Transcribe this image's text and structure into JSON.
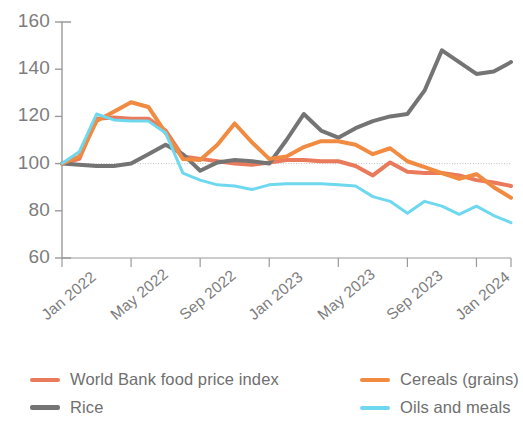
{
  "chart_data": {
    "type": "line",
    "title": "",
    "subtitle": "",
    "xlabel": "",
    "ylabel": "",
    "xlim": [
      0,
      26
    ],
    "ylim": [
      60,
      160
    ],
    "yticks": [
      60,
      80,
      100,
      120,
      140,
      160
    ],
    "xticks": [
      0,
      4,
      8,
      12,
      16,
      20,
      24
    ],
    "xticklabels": [
      "Jan 2022",
      "May 2022",
      "Sep 2022",
      "Jan 2023",
      "May 2023",
      "Sep 2023",
      "Jan 2024"
    ],
    "grid": false,
    "legend_position": "bottom",
    "x": [
      0,
      1,
      2,
      3,
      4,
      5,
      6,
      7,
      8,
      9,
      10,
      11,
      12,
      13,
      14,
      15,
      16,
      17,
      18,
      19,
      20,
      21,
      22,
      23,
      24,
      25,
      26
    ],
    "x_month_labels": [
      "Jan 2022",
      "Feb 2022",
      "Mar 2022",
      "Apr 2022",
      "May 2022",
      "Jun 2022",
      "Jul 2022",
      "Aug 2022",
      "Sep 2022",
      "Oct 2022",
      "Nov 2022",
      "Dec 2022",
      "Jan 2023",
      "Feb 2023",
      "Mar 2023",
      "Apr 2023",
      "May 2023",
      "Jun 2023",
      "Jul 2023",
      "Aug 2023",
      "Sep 2023",
      "Oct 2023",
      "Nov 2023",
      "Dec 2023",
      "Jan 2024",
      "Feb 2024",
      "Mar 2024"
    ],
    "series": [
      {
        "name": "World Bank food price index",
        "color": "#ea7a5c",
        "width": 4,
        "values": [
          100,
          102,
          119,
          119.5,
          119,
          119,
          114,
          103,
          102,
          101,
          100,
          99.5,
          100.5,
          101.5,
          101.5,
          101,
          101,
          99,
          95,
          100.5,
          96.5,
          96,
          96,
          95,
          93,
          92,
          90.5
        ]
      },
      {
        "name": "Rice",
        "color": "#747474",
        "width": 4,
        "values": [
          100,
          99.5,
          99,
          99,
          100,
          104,
          108,
          104,
          97,
          100.5,
          101.5,
          101,
          100,
          110,
          121,
          114,
          111,
          115,
          118,
          120,
          121,
          131,
          148,
          143,
          138,
          139,
          143
        ]
      },
      {
        "name": "Cereals (grains)",
        "color": "#f08b41",
        "width": 4,
        "values": [
          100,
          103,
          118,
          122,
          126,
          124,
          113,
          102,
          101.5,
          108,
          117,
          109,
          102,
          103,
          107,
          109.5,
          109.5,
          108,
          104,
          106.5,
          101,
          98.5,
          96,
          93.5,
          95.5,
          90,
          85.5
        ]
      },
      {
        "name": "Oils and meals",
        "color": "#6ed8ef",
        "width": 3,
        "values": [
          100,
          105,
          121,
          118.5,
          118,
          118,
          113,
          96,
          93,
          91,
          90.5,
          89,
          91,
          91.5,
          91.5,
          91.5,
          91,
          90.5,
          86,
          84,
          79,
          84,
          82,
          78.5,
          82,
          78,
          75
        ]
      }
    ],
    "series_late": {
      "note": "tail points extending to Mar 2024"
    }
  },
  "axis": {
    "ytick_labels": [
      "160",
      "140",
      "120",
      "100",
      "80",
      "60"
    ],
    "xtick_labels": [
      "Jan 2022",
      "May 2022",
      "Sep 2022",
      "Jan 2023",
      "May 2023",
      "Sep 2023",
      "Jan 2024"
    ]
  },
  "legend": {
    "items": [
      {
        "label": "World Bank food price index",
        "color": "#ea7a5c",
        "style": "thin"
      },
      {
        "label": "Cereals (grains)",
        "color": "#f08b41",
        "style": "thin"
      },
      {
        "label": "Rice",
        "color": "#747474",
        "style": "thick"
      },
      {
        "label": "Oils and meals",
        "color": "#6ed8ef",
        "style": "thin"
      }
    ]
  }
}
